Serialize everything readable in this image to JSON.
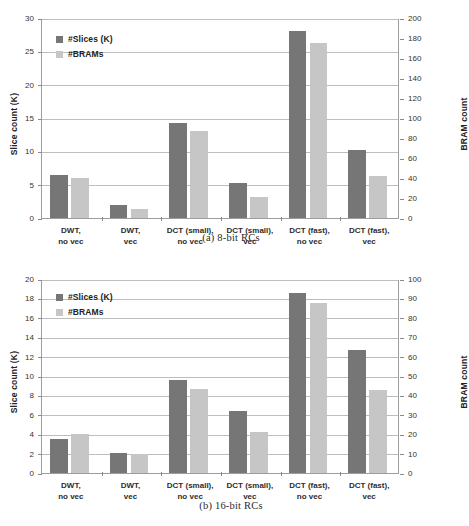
{
  "top_cut_text": "",
  "figures": [
    {
      "id": "fig-a",
      "caption": "(a) 8-bit RCs",
      "legend": {
        "slices": "#Slices (K)",
        "brams": "#BRAMs"
      },
      "ylabel_left": "Slice count (K)",
      "ylabel_right": "BRAM count",
      "left_ticks": [
        "0",
        "5",
        "10",
        "15",
        "20",
        "25",
        "30"
      ],
      "right_ticks": [
        "0",
        "20",
        "40",
        "60",
        "80",
        "100",
        "120",
        "140",
        "160",
        "180",
        "200"
      ],
      "categories": [
        "DWT,\nno vec",
        "DWT,\nvec",
        "DCT (small),\nno vec",
        "DCT (small),\nvec",
        "DCT (fast),\nno vec",
        "DCT (fast),\nvec"
      ]
    },
    {
      "id": "fig-b",
      "caption": "(b) 16-bit RCs",
      "legend": {
        "slices": "#Slices (K)",
        "brams": "#BRAMs"
      },
      "ylabel_left": "Slice count (K)",
      "ylabel_right": "BRAM count",
      "left_ticks": [
        "0",
        "2",
        "4",
        "6",
        "8",
        "10",
        "12",
        "14",
        "16",
        "18",
        "20"
      ],
      "right_ticks": [
        "0",
        "10",
        "20",
        "30",
        "40",
        "50",
        "60",
        "70",
        "80",
        "90",
        "100"
      ],
      "categories": [
        "DWT,\nno vec",
        "DWT,\nvec",
        "DCT (small),\nno vec",
        "DCT (small),\nvec",
        "DCT (fast),\nno vec",
        "DCT (fast),\nvec"
      ]
    }
  ],
  "colors": {
    "slices": "#767676",
    "brams": "#c6c6c6",
    "grid": "#bdbdbd",
    "axis": "#9d9d9d"
  },
  "chart_data": [
    {
      "type": "bar",
      "title": "(a) 8-bit RCs",
      "xlabel": "",
      "ylabel": "Slice count (K)",
      "y2label": "BRAM count",
      "ylim": [
        0,
        30
      ],
      "y2lim": [
        0,
        200
      ],
      "ytick_step": 5,
      "y2tick_step": 20,
      "grid": true,
      "legend_position": "upper-left-inside",
      "categories": [
        "DWT, no vec",
        "DWT, vec",
        "DCT (small), no vec",
        "DCT (small), vec",
        "DCT (fast), no vec",
        "DCT (fast), vec"
      ],
      "series": [
        {
          "name": "#Slices (K)",
          "axis": "left",
          "values": [
            6.5,
            2.0,
            14.3,
            5.2,
            28.0,
            10.2
          ]
        },
        {
          "name": "#BRAMs",
          "axis": "right",
          "values": [
            40,
            9,
            87,
            21,
            175,
            42
          ]
        }
      ]
    },
    {
      "type": "bar",
      "title": "(b) 16-bit RCs",
      "xlabel": "",
      "ylabel": "Slice count (K)",
      "y2label": "BRAM count",
      "ylim": [
        0,
        20
      ],
      "y2lim": [
        0,
        100
      ],
      "ytick_step": 2,
      "y2tick_step": 10,
      "grid": true,
      "legend_position": "upper-left-inside",
      "categories": [
        "DWT, no vec",
        "DWT, vec",
        "DCT (small), no vec",
        "DCT (small), vec",
        "DCT (fast), no vec",
        "DCT (fast), vec"
      ],
      "series": [
        {
          "name": "#Slices (K)",
          "axis": "left",
          "values": [
            3.5,
            2.05,
            9.55,
            6.35,
            18.55,
            12.65
          ]
        },
        {
          "name": "#BRAMs",
          "axis": "right",
          "values": [
            20,
            10,
            43.5,
            21,
            87.5,
            43
          ]
        }
      ]
    }
  ]
}
